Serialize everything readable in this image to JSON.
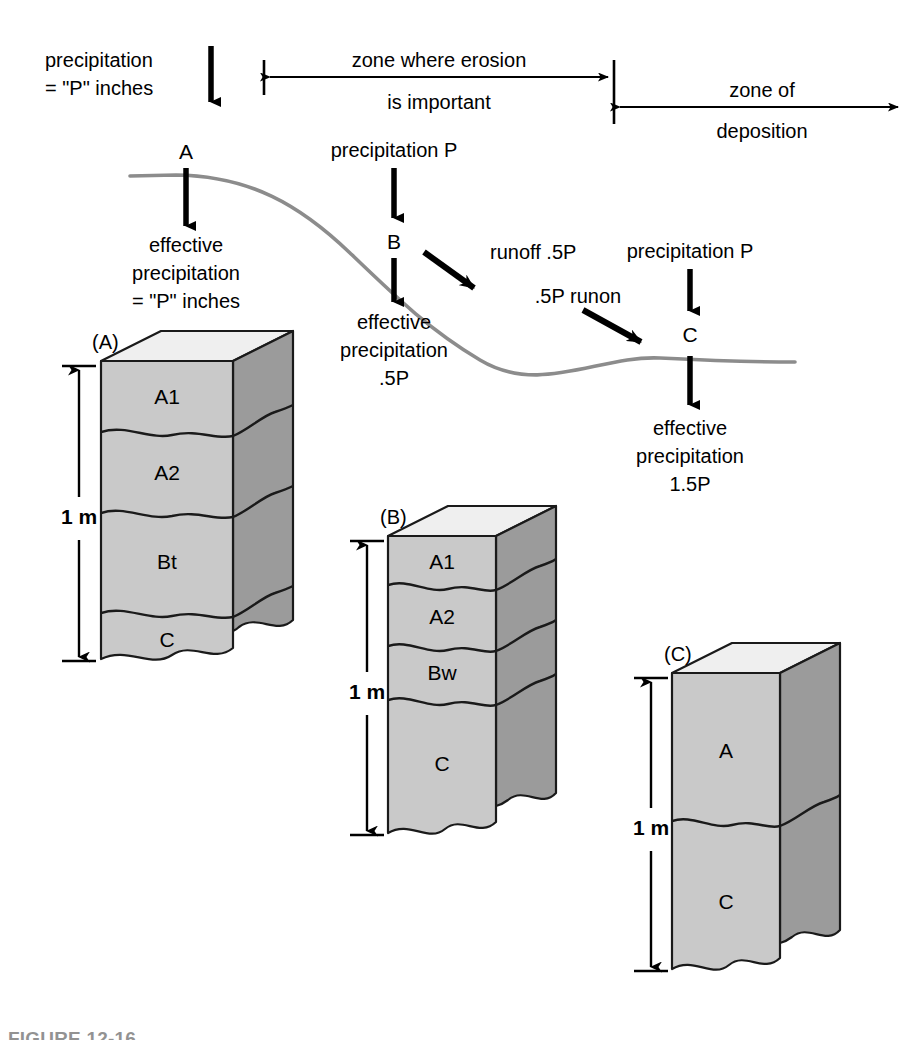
{
  "figure": {
    "caption_partial": "FIGURE 12-16",
    "background_color": "#ffffff",
    "ink_color": "#000000",
    "slope_line_color": "#8c8c8c"
  },
  "colors": {
    "soil_front": "#c9c9c9",
    "soil_side": "#9b9b9b",
    "soil_top": "#efefef",
    "outline": "#1a1a1a",
    "slope": "#8c8c8c"
  },
  "zones": [
    {
      "id": "erosion",
      "line1": "zone where erosion",
      "line2": "is important",
      "arrow_style": "double-ended-left-tick"
    },
    {
      "id": "deposition",
      "line1": "zone of",
      "line2": "deposition",
      "arrow_style": "double-ended-right-open"
    }
  ],
  "slope_annotations": [
    {
      "id": "top-precip",
      "lines": [
        "precipitation",
        "= \"P\" inches"
      ],
      "arrow": "down"
    },
    {
      "id": "point-a",
      "label": "A",
      "arrow": "down",
      "result_lines": [
        "effective",
        "precipitation",
        "= \"P\" inches"
      ]
    },
    {
      "id": "point-b-precip",
      "label": "precipitation P",
      "arrow": "down"
    },
    {
      "id": "point-b",
      "label": "B",
      "arrow": "down",
      "result_lines": [
        "effective",
        "precipitation",
        ".5P"
      ]
    },
    {
      "id": "runoff",
      "label": "runoff .5P",
      "arrow": "diagonal-down-right"
    },
    {
      "id": "runon",
      "label": ".5P runon",
      "arrow": "diagonal-down-right"
    },
    {
      "id": "point-c-precip",
      "label": "precipitation P",
      "arrow": "down"
    },
    {
      "id": "point-c",
      "label": "C",
      "arrow": "down",
      "result_lines": [
        "effective",
        "precipitation",
        "1.5P"
      ]
    }
  ],
  "soil_profiles": [
    {
      "id": "A",
      "block_label": "(A)",
      "depth_label": "1 m",
      "horizons": [
        {
          "name": "A1"
        },
        {
          "name": "A2"
        },
        {
          "name": "Bt"
        },
        {
          "name": "C"
        }
      ]
    },
    {
      "id": "B",
      "block_label": "(B)",
      "depth_label": "1 m",
      "horizons": [
        {
          "name": "A1"
        },
        {
          "name": "A2"
        },
        {
          "name": "Bw"
        },
        {
          "name": "C"
        }
      ]
    },
    {
      "id": "C",
      "block_label": "(C)",
      "depth_label": "1 m",
      "horizons": [
        {
          "name": "A"
        },
        {
          "name": "C"
        }
      ]
    }
  ]
}
